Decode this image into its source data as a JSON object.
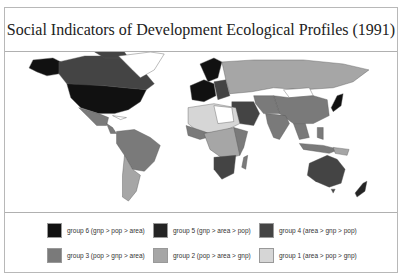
{
  "title": "Social Indicators of Development Ecological Profiles (1991)",
  "map": {
    "type": "choropleth world map",
    "regions": {
      "north_america_us": "group 6",
      "canada": "group 4",
      "greenland": "none",
      "alaska": "group 6",
      "mexico": "group 3",
      "central_america": "group 3",
      "south_america_brazil": "group 3",
      "south_america_argentina": "group 2",
      "western_europe": "group 6",
      "scandinavia": "group 6",
      "eastern_europe": "group 4",
      "ussr": "group 2",
      "mongolia": "none",
      "china": "group 3",
      "japan": "group 6",
      "india": "group 3",
      "middle_east_saudi": "group 5",
      "north_africa": "group 1",
      "central_africa": "group 2",
      "south_africa": "group 4",
      "southeast_asia": "group 3",
      "indonesia": "group 3",
      "australia": "group 5",
      "new_zealand": "group 5"
    }
  },
  "legend": {
    "items": [
      {
        "label": "group 6 (gnp > pop > area)",
        "color": "#111111"
      },
      {
        "label": "group 5 (gnp > area > pop)",
        "color": "#242424"
      },
      {
        "label": "group 4 (area > gnp > pop)",
        "color": "#444444"
      },
      {
        "label": "group 3 (pop > gnp > area)",
        "color": "#7a7a7a"
      },
      {
        "label": "group 2 (pop > area > gnp)",
        "color": "#a6a6a6"
      },
      {
        "label": "group 1 (area > pop > gnp)",
        "color": "#d6d6d6"
      }
    ]
  }
}
